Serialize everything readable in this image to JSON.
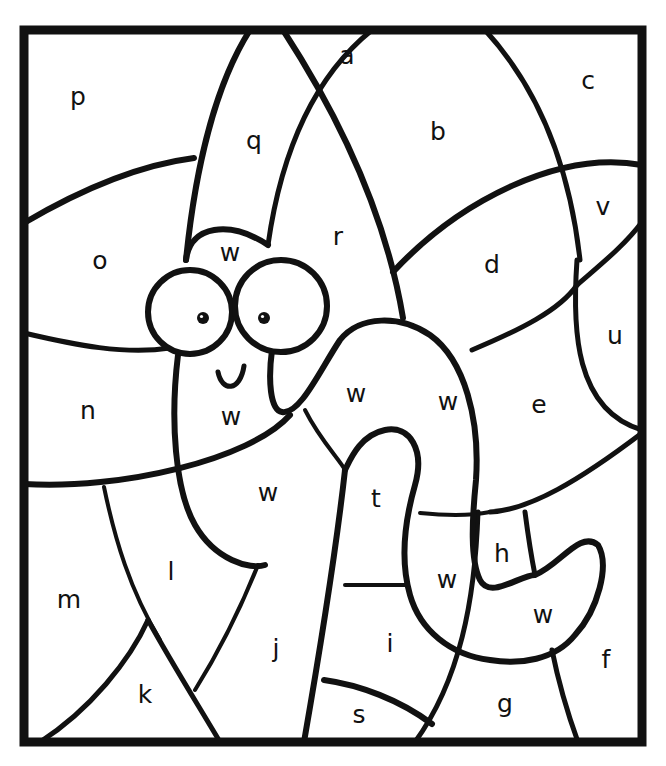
{
  "page": {
    "kind": "color-by-letter worksheet",
    "background": "#ffffff",
    "ink": "#111111"
  },
  "frame": {
    "x": 24,
    "y": 30,
    "width": 618,
    "height": 712,
    "stroke_width": 9
  },
  "regions": [
    {
      "letter": "a",
      "x": 347,
      "y": 57
    },
    {
      "letter": "b",
      "x": 438,
      "y": 133
    },
    {
      "letter": "c",
      "x": 588,
      "y": 82
    },
    {
      "letter": "p",
      "x": 78,
      "y": 98
    },
    {
      "letter": "q",
      "x": 254,
      "y": 142
    },
    {
      "letter": "r",
      "x": 338,
      "y": 238
    },
    {
      "letter": "v",
      "x": 603,
      "y": 208
    },
    {
      "letter": "o",
      "x": 100,
      "y": 262
    },
    {
      "letter": "d",
      "x": 492,
      "y": 266
    },
    {
      "letter": "w",
      "x": 230,
      "y": 254
    },
    {
      "letter": "u",
      "x": 615,
      "y": 337
    },
    {
      "letter": "n",
      "x": 88,
      "y": 412
    },
    {
      "letter": "w",
      "x": 231,
      "y": 418
    },
    {
      "letter": "w",
      "x": 356,
      "y": 395
    },
    {
      "letter": "w",
      "x": 448,
      "y": 403
    },
    {
      "letter": "e",
      "x": 539,
      "y": 406
    },
    {
      "letter": "w",
      "x": 268,
      "y": 494
    },
    {
      "letter": "t",
      "x": 376,
      "y": 500
    },
    {
      "letter": "h",
      "x": 502,
      "y": 555
    },
    {
      "letter": "l",
      "x": 171,
      "y": 573
    },
    {
      "letter": "w",
      "x": 447,
      "y": 581
    },
    {
      "letter": "w",
      "x": 543,
      "y": 616
    },
    {
      "letter": "m",
      "x": 69,
      "y": 601
    },
    {
      "letter": "j",
      "x": 276,
      "y": 650
    },
    {
      "letter": "i",
      "x": 390,
      "y": 645
    },
    {
      "letter": "f",
      "x": 606,
      "y": 661
    },
    {
      "letter": "k",
      "x": 145,
      "y": 696
    },
    {
      "letter": "g",
      "x": 505,
      "y": 705
    },
    {
      "letter": "s",
      "x": 359,
      "y": 716
    }
  ],
  "lines": [
    {
      "id": "q-left-arc",
      "w": 6,
      "d": "M 250 30 C 215 85 195 170 186 260"
    },
    {
      "id": "q-right-arc",
      "w": 6,
      "d": "M 283 30 C 335 110 385 210 403 318"
    },
    {
      "id": "b-left-arc",
      "w": 5,
      "d": "M 372 30 C 310 80 280 160 268 245"
    },
    {
      "id": "c-arc",
      "w": 5,
      "d": "M 485 30 C 540 90 570 170 580 260"
    },
    {
      "id": "p-o-divider",
      "w": 6,
      "d": "M 24 223 C 80 190 140 165 194 158"
    },
    {
      "id": "d-top-arc",
      "w": 6,
      "d": "M 393 272 C 460 200 560 150 642 165"
    },
    {
      "id": "v-u-divider",
      "w": 5,
      "d": "M 577 285 C 600 265 625 245 642 222"
    },
    {
      "id": "d-bottom-arc",
      "w": 5,
      "d": "M 472 350 C 520 330 560 310 577 285"
    },
    {
      "id": "u-left-arc",
      "w": 5,
      "d": "M 577 260 C 572 330 575 410 642 430"
    },
    {
      "id": "o-n-divider",
      "w": 5,
      "d": "M 24 333 C 75 345 125 355 170 348"
    },
    {
      "id": "n-bottom",
      "w": 6,
      "d": "M 24 484 C 120 490 250 460 290 415"
    },
    {
      "id": "e-bottom-arc",
      "w": 5,
      "d": "M 642 433 C 580 480 530 510 490 512"
    },
    {
      "id": "t-h-divider",
      "w": 4,
      "d": "M 420 513 C 450 516 470 516 490 512"
    },
    {
      "id": "h-right",
      "w": 5,
      "d": "M 525 512 C 528 535 532 560 535 575"
    },
    {
      "id": "m-l-divider",
      "w": 4,
      "d": "M 104 487 C 115 540 130 590 160 640"
    },
    {
      "id": "k-left",
      "w": 5,
      "d": "M 148 620 C 130 660 90 710 40 742"
    },
    {
      "id": "k-right",
      "w": 5,
      "d": "M 148 620 C 170 660 195 700 220 742"
    },
    {
      "id": "l-j-divider",
      "w": 4,
      "d": "M 258 565 C 240 610 220 650 195 690"
    },
    {
      "id": "j-s-divider",
      "w": 6,
      "d": "M 345 470 C 335 560 320 650 304 742"
    },
    {
      "id": "t-i-divider",
      "w": 4,
      "d": "M 345 585 C 360 585 380 585 405 585"
    },
    {
      "id": "s-top",
      "w": 6,
      "d": "M 324 680 C 360 685 400 700 432 724"
    },
    {
      "id": "i-right",
      "w": 5,
      "d": "M 478 512 C 475 600 460 680 415 742"
    },
    {
      "id": "g-f-divider",
      "w": 5,
      "d": "M 552 650 C 560 690 570 720 578 742"
    },
    {
      "id": "head-top",
      "w": 6,
      "d": "M 186 260 C 190 225 230 220 268 245"
    },
    {
      "id": "body-left",
      "w": 6,
      "d": "M 178 355 C 170 420 175 490 195 525 C 215 560 250 570 265 565"
    },
    {
      "id": "body-right",
      "w": 6,
      "d": "M 272 350 C 268 380 270 410 282 412 C 300 415 320 370 340 340 C 360 315 400 315 430 335 C 465 360 480 420 476 480 C 472 520 470 560 480 580 C 490 600 520 575 535 575 C 560 565 580 530 598 545 C 610 565 598 610 575 635 C 555 660 520 665 490 660 C 450 655 420 630 410 595 C 400 560 405 520 415 485 C 425 450 410 425 385 430 C 360 435 350 460 345 470"
    },
    {
      "id": "worm-w-divider",
      "w": 4,
      "d": "M 305 410 C 320 440 340 460 345 470"
    }
  ],
  "eyes": [
    {
      "name": "left-eye",
      "cx": 190,
      "cy": 312,
      "r": 42,
      "pupil_cx": 203,
      "pupil_cy": 318,
      "pupil_r": 6
    },
    {
      "name": "right-eye",
      "cx": 281,
      "cy": 306,
      "r": 46,
      "pupil_cx": 264,
      "pupil_cy": 318,
      "pupil_r": 6
    }
  ],
  "mouth": {
    "d": "M 218 372 C 222 392 240 392 244 366"
  }
}
